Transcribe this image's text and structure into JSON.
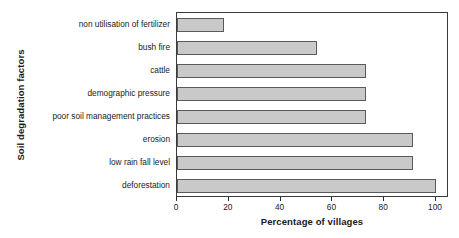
{
  "chart_data": {
    "type": "bar",
    "orientation": "horizontal",
    "title": "",
    "xlabel": "Percentage of villages",
    "ylabel": "Soil degradation factors",
    "xlim": [
      0,
      100
    ],
    "xticks": [
      0,
      20,
      40,
      60,
      80,
      100
    ],
    "grid": false,
    "legend": null,
    "bar_fill_color": "#c9c9c9",
    "bar_edge_color": "#5a5a5a",
    "categories": [
      "non utilisation of fertilizer",
      "bush fire",
      "cattle",
      "demographic pressure",
      "poor soil management practices",
      "erosion",
      "low rain fall level",
      "deforestation"
    ],
    "values": [
      18,
      54,
      73,
      73,
      73,
      91,
      91,
      100
    ]
  }
}
